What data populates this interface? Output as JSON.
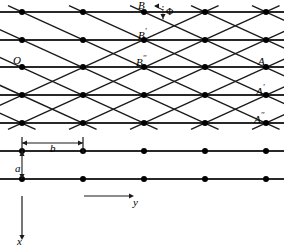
{
  "figure": {
    "type": "lattice-diagram",
    "background_color": "#ffffff",
    "line_color": "#1a1a1a",
    "dot_color": "#000000"
  },
  "labels": {
    "origin": "O",
    "b_top": "B",
    "b_prime": "B",
    "b_prime_mark": "'",
    "b_double": "B",
    "b_double_mark": "''",
    "a_right": "A",
    "a_right_prime": "A",
    "a_right_prime_mark": "'",
    "a_right_double": "A",
    "a_right_double_mark": "''",
    "phi": "Φ",
    "spacing_b": "b",
    "spacing_a": "a",
    "axis_y": "y",
    "axis_x": "x"
  },
  "lattice": {
    "columns": 5,
    "rows": 7,
    "column_spacing_px": 61,
    "row_spacing_px": 27.8,
    "first_column_x": 22,
    "first_row_y": 12,
    "dot_radius_px": 3
  },
  "annotations": {
    "b_dimension_label": "b",
    "b_dimension_from_column": 1,
    "b_dimension_to_column": 2,
    "a_dimension_label": "a",
    "a_dimension_from_row": 6,
    "a_dimension_to_row": 7,
    "angle_label": "Φ",
    "angle_at_point": "B",
    "axis_x_direction": "down",
    "axis_y_direction": "right"
  },
  "chart_data": {
    "type": "scatter",
    "xlabel": "y",
    "ylabel": "x",
    "columns_x": [
      22,
      83,
      144,
      205,
      266
    ],
    "rows_y": [
      12,
      40,
      67,
      95,
      123,
      151,
      179
    ],
    "diagonal_slope_rows_per_column": 1,
    "grid": false,
    "legend": "none"
  }
}
